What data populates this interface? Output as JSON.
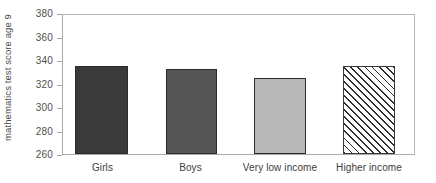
{
  "chart_data": {
    "type": "bar",
    "title": "",
    "xlabel": "",
    "ylabel": "mathematics test score age 9",
    "ylim": [
      260,
      380
    ],
    "yticks": [
      260,
      280,
      300,
      320,
      340,
      360,
      380
    ],
    "grid": false,
    "legend": "none",
    "categories": [
      "Girls",
      "Boys",
      "Very low income",
      "Higher income"
    ],
    "values": [
      336,
      333.5,
      325.5,
      336
    ],
    "bar_styles": [
      {
        "label": "Girls",
        "fill": "#3a3a3a",
        "pattern": "solid"
      },
      {
        "label": "Boys",
        "fill": "#555555",
        "pattern": "solid"
      },
      {
        "label": "Very low income",
        "fill": "#b8b8b8",
        "pattern": "solid"
      },
      {
        "label": "Higher income",
        "fill": "#ffffff",
        "pattern": "diagonal-hatch"
      }
    ]
  },
  "axis": {
    "y_title": "mathematics test score age 9",
    "tick_labels": [
      "380",
      "360",
      "340",
      "320",
      "300",
      "280",
      "260"
    ]
  },
  "categories": {
    "c0": "Girls",
    "c1": "Boys",
    "c2": "Very low income",
    "c3": "Higher income"
  },
  "colors": {
    "frame": "#a9a9a9",
    "bar_girls": "#3a3a3a",
    "bar_boys": "#555555",
    "bar_very_low_income": "#b8b8b8",
    "bar_higher_income": "#ffffff",
    "hatch_stroke": "#2e2e2e",
    "text": "#4a4a4a",
    "background": "#ffffff"
  }
}
